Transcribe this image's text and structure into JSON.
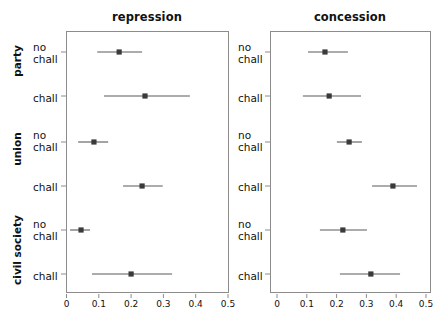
{
  "figure": {
    "width": 441,
    "height": 317,
    "background": "#ffffff",
    "point_color": "#3a3a3a",
    "line_color": "#5a5a5a",
    "frame_color": "#8c8c8c"
  },
  "panels": [
    {
      "key": "repression",
      "title": "repression"
    },
    {
      "key": "concession",
      "title": "concession"
    }
  ],
  "groups": [
    {
      "key": "party",
      "label": "party"
    },
    {
      "key": "union",
      "label": "union"
    },
    {
      "key": "civil_society",
      "label": "civil society"
    }
  ],
  "row_labels": [
    "no\nchall",
    "chall",
    "no\nchall",
    "chall",
    "no\nchall",
    "chall"
  ],
  "row_labels_flat": [
    {
      "line1": "no",
      "line2": "chall"
    },
    {
      "line1": "chall",
      "line2": ""
    },
    {
      "line1": "no",
      "line2": "chall"
    },
    {
      "line1": "chall",
      "line2": ""
    },
    {
      "line1": "no",
      "line2": "chall"
    },
    {
      "line1": "chall",
      "line2": ""
    }
  ],
  "axis": {
    "ticks": [
      0,
      0.1,
      0.2,
      0.3,
      0.4,
      0.5
    ],
    "tick_labels": [
      "0",
      "0.1",
      "0.2",
      "0.3",
      "0.4",
      "0.5"
    ],
    "xlim": [
      0,
      0.5
    ],
    "grid": false
  },
  "chart_data": {
    "type": "scatter",
    "title": "",
    "subtitle": "",
    "xlabel": "",
    "ylabel": "",
    "xlim": [
      0,
      0.5
    ],
    "grid": false,
    "legend_position": "none",
    "orientation": "horizontal",
    "plot_style": "dot-and-whisker coefficient plot",
    "categories": [
      "party / no chall",
      "party / chall",
      "union / no chall",
      "union / chall",
      "civil society / no chall",
      "civil society / chall"
    ],
    "xticks": [
      0,
      0.1,
      0.2,
      0.3,
      0.4,
      0.5
    ],
    "xticklabels": [
      "0",
      "0.1",
      "0.2",
      "0.3",
      "0.4",
      "0.5"
    ],
    "panels": [
      {
        "name": "repression",
        "points": [
          {
            "category": "party / no chall",
            "estimate": 0.163,
            "ci_low": 0.095,
            "ci_high": 0.234
          },
          {
            "category": "party / chall",
            "estimate": 0.243,
            "ci_low": 0.116,
            "ci_high": 0.382
          },
          {
            "category": "union / no chall",
            "estimate": 0.085,
            "ci_low": 0.036,
            "ci_high": 0.129
          },
          {
            "category": "union / chall",
            "estimate": 0.234,
            "ci_low": 0.175,
            "ci_high": 0.298
          },
          {
            "category": "civil society / no chall",
            "estimate": 0.045,
            "ci_low": 0.011,
            "ci_high": 0.073
          },
          {
            "category": "civil society / chall",
            "estimate": 0.2,
            "ci_low": 0.079,
            "ci_high": 0.327
          }
        ]
      },
      {
        "name": "concession",
        "points": [
          {
            "category": "party / no chall",
            "estimate": 0.161,
            "ci_low": 0.104,
            "ci_high": 0.238
          },
          {
            "category": "party / chall",
            "estimate": 0.175,
            "ci_low": 0.087,
            "ci_high": 0.282
          },
          {
            "category": "union / no chall",
            "estimate": 0.242,
            "ci_low": 0.201,
            "ci_high": 0.285
          },
          {
            "category": "union / chall",
            "estimate": 0.389,
            "ci_low": 0.319,
            "ci_high": 0.47
          },
          {
            "category": "civil society / no chall",
            "estimate": 0.221,
            "ci_low": 0.144,
            "ci_high": 0.302
          },
          {
            "category": "civil society / chall",
            "estimate": 0.315,
            "ci_low": 0.211,
            "ci_high": 0.413
          }
        ]
      }
    ]
  }
}
